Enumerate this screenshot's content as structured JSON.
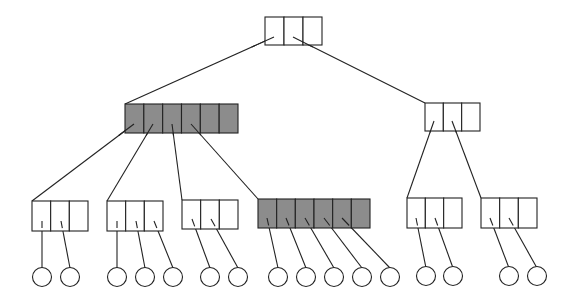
{
  "diagram": {
    "colors": {
      "fill_highlight": "#8c8c8c",
      "fill_normal": "#ffffff",
      "stroke": "#222222"
    },
    "nodes": [
      {
        "id": "root",
        "x": 265,
        "y": 17,
        "cells": 3,
        "w": 57,
        "h": 28,
        "highlight": false
      },
      {
        "id": "mid-left",
        "x": 125,
        "y": 104,
        "cells": 6,
        "w": 113,
        "h": 29,
        "highlight": true
      },
      {
        "id": "mid-right",
        "x": 425,
        "y": 103,
        "cells": 3,
        "w": 55,
        "h": 28,
        "highlight": false
      },
      {
        "id": "leaf-1",
        "x": 32,
        "y": 201,
        "cells": 3,
        "w": 56,
        "h": 30,
        "highlight": false
      },
      {
        "id": "leaf-2",
        "x": 107,
        "y": 201,
        "cells": 3,
        "w": 56,
        "h": 30,
        "highlight": false
      },
      {
        "id": "leaf-3",
        "x": 182,
        "y": 200,
        "cells": 3,
        "w": 56,
        "h": 29,
        "highlight": false
      },
      {
        "id": "leaf-4",
        "x": 258,
        "y": 199,
        "cells": 6,
        "w": 112,
        "h": 29,
        "highlight": true
      },
      {
        "id": "leaf-5",
        "x": 407,
        "y": 198,
        "cells": 3,
        "w": 55,
        "h": 30,
        "highlight": false
      },
      {
        "id": "leaf-6",
        "x": 481,
        "y": 198,
        "cells": 3,
        "w": 56,
        "h": 30,
        "highlight": false
      }
    ],
    "edges": [
      {
        "from": [
          274,
          37
        ],
        "to": [
          125,
          104
        ]
      },
      {
        "from": [
          293,
          37
        ],
        "to": [
          425,
          103
        ]
      },
      {
        "from": [
          134,
          124
        ],
        "to": [
          32,
          201
        ]
      },
      {
        "from": [
          153,
          124
        ],
        "to": [
          107,
          201
        ]
      },
      {
        "from": [
          172,
          124
        ],
        "to": [
          182,
          200
        ]
      },
      {
        "from": [
          191,
          124
        ],
        "to": [
          258,
          199
        ]
      },
      {
        "from": [
          434,
          121
        ],
        "to": [
          407,
          198
        ]
      },
      {
        "from": [
          452,
          121
        ],
        "to": [
          481,
          198
        ]
      },
      {
        "from": [
          42,
          221
        ],
        "to": [
          42,
          268
        ]
      },
      {
        "from": [
          61,
          221
        ],
        "to": [
          70,
          268
        ]
      },
      {
        "from": [
          117,
          221
        ],
        "to": [
          117,
          268
        ]
      },
      {
        "from": [
          136,
          221
        ],
        "to": [
          145,
          268
        ]
      },
      {
        "from": [
          154,
          221
        ],
        "to": [
          173,
          268
        ]
      },
      {
        "from": [
          192,
          219
        ],
        "to": [
          210,
          268
        ]
      },
      {
        "from": [
          211,
          219
        ],
        "to": [
          238,
          268
        ]
      },
      {
        "from": [
          267,
          218
        ],
        "to": [
          278,
          268
        ]
      },
      {
        "from": [
          286,
          218
        ],
        "to": [
          306,
          268
        ]
      },
      {
        "from": [
          305,
          218
        ],
        "to": [
          334,
          268
        ]
      },
      {
        "from": [
          324,
          218
        ],
        "to": [
          362,
          268
        ]
      },
      {
        "from": [
          342,
          218
        ],
        "to": [
          390,
          268
        ]
      },
      {
        "from": [
          416,
          218
        ],
        "to": [
          426,
          268
        ]
      },
      {
        "from": [
          435,
          218
        ],
        "to": [
          453,
          268
        ]
      },
      {
        "from": [
          490,
          218
        ],
        "to": [
          509,
          268
        ]
      },
      {
        "from": [
          509,
          218
        ],
        "to": [
          537,
          268
        ]
      }
    ],
    "records": [
      {
        "cx": 42,
        "cy": 277
      },
      {
        "cx": 70,
        "cy": 277
      },
      {
        "cx": 117,
        "cy": 277
      },
      {
        "cx": 145,
        "cy": 277
      },
      {
        "cx": 173,
        "cy": 277
      },
      {
        "cx": 210,
        "cy": 277
      },
      {
        "cx": 238,
        "cy": 277
      },
      {
        "cx": 278,
        "cy": 277
      },
      {
        "cx": 306,
        "cy": 277
      },
      {
        "cx": 334,
        "cy": 277
      },
      {
        "cx": 362,
        "cy": 277
      },
      {
        "cx": 390,
        "cy": 277
      },
      {
        "cx": 426,
        "cy": 276
      },
      {
        "cx": 453,
        "cy": 276
      },
      {
        "cx": 509,
        "cy": 276
      },
      {
        "cx": 537,
        "cy": 276
      }
    ],
    "record_radius": 9.5
  }
}
